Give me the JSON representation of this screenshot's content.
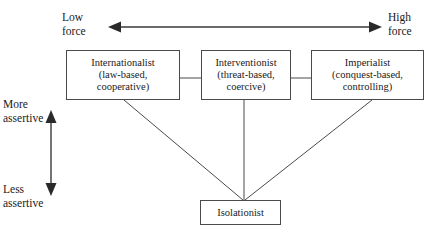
{
  "diagram": {
    "type": "node-diagram",
    "background_color": "#ffffff",
    "line_color": "#4a4a4a",
    "text_color": "#1a1a1a"
  },
  "axes": {
    "horizontal": {
      "left_label": "Low\nforce",
      "right_label": "High\nforce",
      "arrow_style": "double-headed",
      "orientation": "horizontal"
    },
    "vertical": {
      "top_label": "More\nassertive",
      "bottom_label": "Less\nassertive",
      "arrow_style": "double-headed",
      "orientation": "vertical"
    }
  },
  "nodes": [
    {
      "id": "internationalist",
      "label": "Internationalist\n(law-based,\ncooperative)",
      "name": "Internationalist",
      "descriptor": "law-based, cooperative"
    },
    {
      "id": "interventionist",
      "label": "Interventionist\n(threat-based,\ncoercive)",
      "name": "Interventionist",
      "descriptor": "threat-based, coercive"
    },
    {
      "id": "imperialist",
      "label": "Imperialist\n(conquest-based,\ncontrolling)",
      "name": "Imperialist",
      "descriptor": "conquest-based, controlling"
    },
    {
      "id": "isolationist",
      "label": "Isolationist",
      "name": "Isolationist",
      "descriptor": ""
    }
  ],
  "connectors": [
    {
      "from": "internationalist",
      "to": "interventionist",
      "style": "horizontal-line"
    },
    {
      "from": "interventionist",
      "to": "imperialist",
      "style": "horizontal-line"
    },
    {
      "from": "internationalist",
      "to": "isolationist",
      "style": "diagonal-line"
    },
    {
      "from": "interventionist",
      "to": "isolationist",
      "style": "vertical-line"
    },
    {
      "from": "imperialist",
      "to": "isolationist",
      "style": "diagonal-line"
    }
  ]
}
